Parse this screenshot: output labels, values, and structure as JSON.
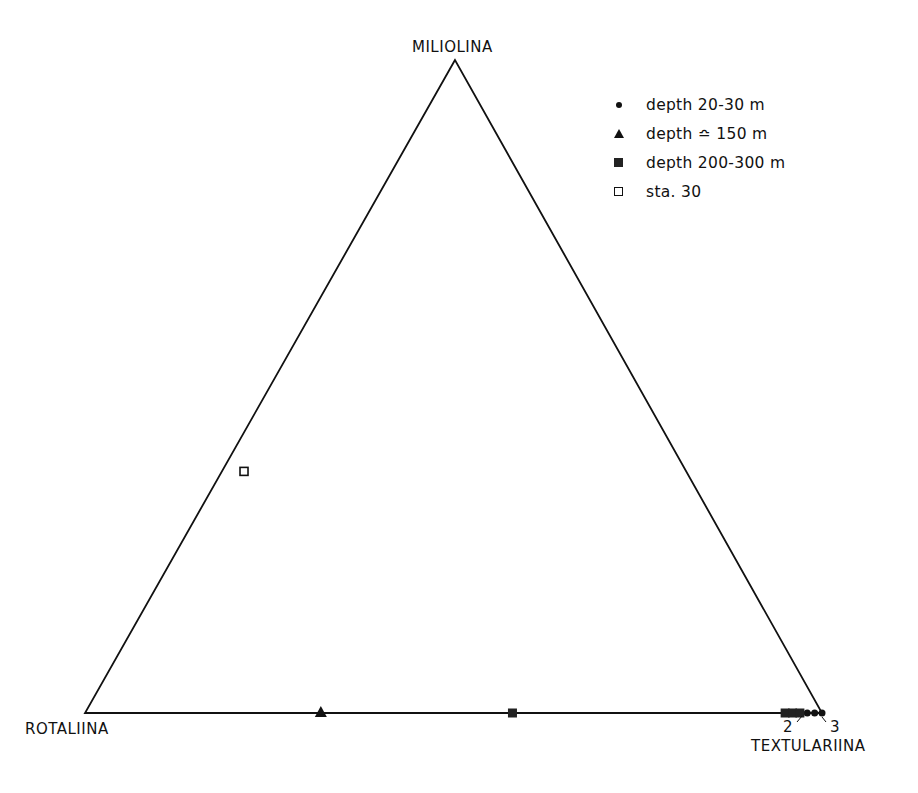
{
  "chart_data": {
    "type": "scatter",
    "subtype": "ternary",
    "title": "",
    "axes": {
      "top": "MILIOLINA",
      "left": "ROTALIINA",
      "right": "TEXTULARIINA"
    },
    "legend": {
      "position": "top-right",
      "entries": [
        {
          "marker": "filled-circle",
          "label": "depth 20-30 m"
        },
        {
          "marker": "filled-triangle",
          "label": "depth ≏ 150 m"
        },
        {
          "marker": "filled-square",
          "label": "depth 200-300 m"
        },
        {
          "marker": "open-square",
          "label": "sta. 30"
        }
      ]
    },
    "series": [
      {
        "name": "depth 20-30 m",
        "marker": "filled-circle",
        "points": [
          {
            "miliolina": 0.0,
            "rotaliina": 0.02,
            "textulariina": 0.98
          },
          {
            "miliolina": 0.0,
            "rotaliina": 0.01,
            "textulariina": 0.99
          },
          {
            "miliolina": 0.0,
            "rotaliina": 0.0,
            "textulariina": 1.0
          }
        ]
      },
      {
        "name": "depth ≏ 150 m",
        "marker": "filled-triangle",
        "points": [
          {
            "miliolina": 0.0,
            "rotaliina": 0.68,
            "textulariina": 0.32
          }
        ]
      },
      {
        "name": "depth 200-300 m",
        "marker": "filled-square",
        "points": [
          {
            "miliolina": 0.0,
            "rotaliina": 0.42,
            "textulariina": 0.58
          },
          {
            "miliolina": 0.0,
            "rotaliina": 0.05,
            "textulariina": 0.95
          },
          {
            "miliolina": 0.0,
            "rotaliina": 0.04,
            "textulariina": 0.96
          },
          {
            "miliolina": 0.0,
            "rotaliina": 0.03,
            "textulariina": 0.97
          }
        ]
      },
      {
        "name": "sta. 30",
        "marker": "open-square",
        "points": [
          {
            "miliolina": 0.37,
            "rotaliina": 0.6,
            "textulariina": 0.03
          }
        ]
      }
    ],
    "annotations": [
      {
        "text": "2",
        "near": "cluster near TEXTULARIINA vertex (left)"
      },
      {
        "text": "3",
        "near": "cluster near TEXTULARIINA vertex (right)"
      }
    ],
    "grid": false
  },
  "labels": {
    "top_vertex": "MILIOLINA",
    "left_vertex": "ROTALIINA",
    "right_vertex": "TEXTULARIINA",
    "annot_2": "2",
    "annot_3": "3"
  },
  "legend_items": [
    {
      "label": "depth 20-30 m"
    },
    {
      "label": "depth ≏ 150 m"
    },
    {
      "label": "depth 200-300 m"
    },
    {
      "label": "sta. 30"
    }
  ],
  "colors": {
    "ink": "#111111",
    "background": "#ffffff"
  }
}
